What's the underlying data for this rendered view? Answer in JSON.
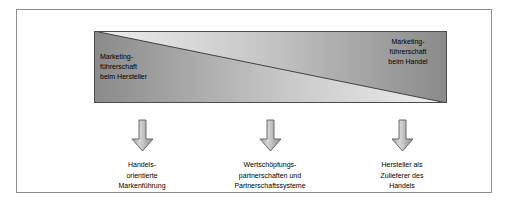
{
  "figure": {
    "background_color": "#ffffff",
    "frame_border_color": "#8d8d8d"
  },
  "bar": {
    "name": "marketing-leadership-gradient-bar",
    "dark_color": "#7a7a7a",
    "light_color": "#f2f2f2",
    "outline_color": "#4a4a4a",
    "left_label": {
      "lines": [
        "Marketing-",
        "führerschaft",
        "beim Hersteller"
      ]
    },
    "right_label": {
      "lines": [
        "Marketing-",
        "führerschaft",
        "beim Handel"
      ]
    }
  },
  "arrows": [
    {
      "name": "arrow-down-1",
      "icon": "arrow-down-icon"
    },
    {
      "name": "arrow-down-2",
      "icon": "arrow-down-icon"
    },
    {
      "name": "arrow-down-3",
      "icon": "arrow-down-icon"
    }
  ],
  "captions": [
    {
      "lines": [
        "Handels-",
        "orientierte",
        "Markenführung"
      ]
    },
    {
      "lines": [
        "Wertschöpfungs-",
        "partnerschaften und",
        "Partnerschaftssysteme"
      ]
    },
    {
      "lines": [
        "Hersteller als",
        "Zulieferer des",
        "Handels"
      ]
    }
  ]
}
